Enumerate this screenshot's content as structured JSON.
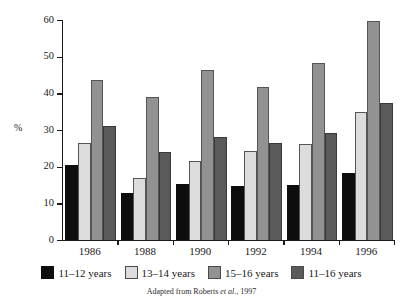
{
  "chart_data": {
    "type": "bar",
    "title": "",
    "xlabel": "",
    "ylabel": "%",
    "ylim": [
      0,
      60
    ],
    "yticks": [
      0,
      10,
      20,
      30,
      40,
      50,
      60
    ],
    "grid": false,
    "legend_position": "bottom",
    "categories": [
      "1986",
      "1988",
      "1990",
      "1992",
      "1994",
      "1996"
    ],
    "series": [
      {
        "name": "11–12 years",
        "color": "#0d0d0d",
        "values": [
          20.4,
          12.8,
          15.3,
          14.7,
          14.9,
          18.4
        ]
      },
      {
        "name": "13–14 years",
        "color": "#dcdcdc",
        "values": [
          26.4,
          16.8,
          21.6,
          24.4,
          26.1,
          35.0
        ]
      },
      {
        "name": "15–16 years",
        "color": "#929292",
        "values": [
          43.6,
          39.1,
          46.3,
          41.6,
          48.2,
          59.7
        ]
      },
      {
        "name": "11–16 years",
        "color": "#5a5a5a",
        "values": [
          31.0,
          23.9,
          28.2,
          26.4,
          29.2,
          37.4
        ]
      }
    ],
    "annotations": [
      "Adapted from Roberts et al., 1997"
    ]
  },
  "axis": {
    "y_title": "%",
    "y_tick_labels": [
      "0",
      "10",
      "20",
      "30",
      "40",
      "50",
      "60"
    ],
    "x_tick_labels": [
      "1986",
      "1988",
      "1990",
      "1992",
      "1994",
      "1996"
    ]
  },
  "legend": {
    "items": [
      {
        "label": "11–12 years",
        "swatch": "black-swatch"
      },
      {
        "label": "13–14 years",
        "swatch": "light-gray-swatch"
      },
      {
        "label": "15–16 years",
        "swatch": "medium-gray-swatch"
      },
      {
        "label": "11–16 years",
        "swatch": "dark-gray-swatch"
      }
    ]
  },
  "footer": {
    "attribution_prefix": "Adapted from Roberts ",
    "attribution_italic": "et al.",
    "attribution_suffix": ", 1997"
  }
}
